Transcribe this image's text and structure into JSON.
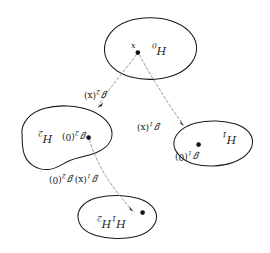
{
  "figure": {
    "kind": "mathematical-set-diagram",
    "background_color": "#ffffff",
    "outline_color": "#1a1a1a",
    "arrow_color": "#8d8d8d",
    "point_color": "#111111",
    "text_orientation": "rotated-180",
    "regions": [
      {
        "id": "h0",
        "label_base": "H",
        "label_sub": "0",
        "point_label": "x",
        "position": "top"
      },
      {
        "id": "h2",
        "label_base": "H",
        "label_sub": "2",
        "point_label_base": "ℊ",
        "point_label_sub": "2",
        "point_label_arg": "(0)",
        "position": "left"
      },
      {
        "id": "h1",
        "label_base": "H",
        "label_sub": "1",
        "point_label_base": "ℊ",
        "point_label_sub": "1",
        "point_label_arg": "(0)",
        "position": "right"
      },
      {
        "id": "h1h2",
        "label_base_1": "H",
        "label_sub_1": "1",
        "label_base_2": "H",
        "label_sub_2": "2",
        "position": "bottom"
      }
    ],
    "arrows": [
      {
        "id": "arrow-h0-to-h2",
        "from": "h0",
        "to": "h2",
        "label_base": "ℊ",
        "label_sub": "2",
        "label_arg": "(x)"
      },
      {
        "id": "arrow-h0-to-h1",
        "from": "h0",
        "to": "h1",
        "label_base": "ℊ",
        "label_sub": "1",
        "label_arg": "(x)"
      },
      {
        "id": "arrow-h2-to-h1h2",
        "from": "h2",
        "to": "h1h2",
        "label_base_1": "ℊ",
        "label_sub_1": "1",
        "label_arg_1": "(x)",
        "label_base_2": "ℊ",
        "label_sub_2": "2",
        "label_arg_2": "(0)"
      }
    ]
  }
}
